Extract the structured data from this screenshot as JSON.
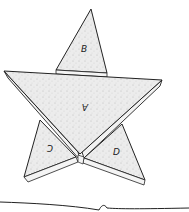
{
  "diagram": {
    "type": "folded paper star",
    "labels": {
      "top_flap": "B",
      "center": "A",
      "left_flap": "C",
      "right_flap": "D"
    },
    "colors": {
      "stroke": "#222222",
      "fill": "#e6e6e6",
      "background": "#ffffff"
    }
  }
}
